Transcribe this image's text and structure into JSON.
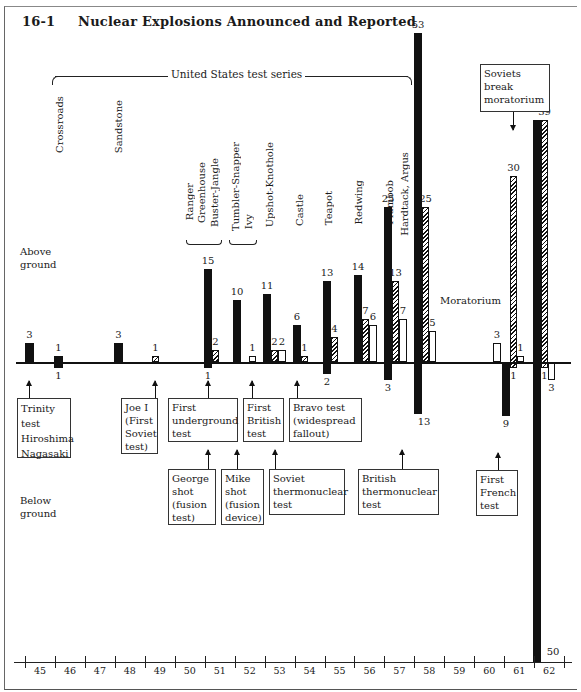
{
  "figure": {
    "number": "16-1",
    "title": "Nuclear Explosions Announced and Reported"
  },
  "labels": {
    "us_series": "United States test series",
    "above_ground": [
      "Above",
      "ground"
    ],
    "below_ground": [
      "Below",
      "ground"
    ],
    "moratorium": "Moratorium"
  },
  "test_series": [
    {
      "name": "Crossroads",
      "year": 46
    },
    {
      "name": "Sandstone",
      "year": 48
    },
    {
      "name": "Ranger",
      "year": 51
    },
    {
      "name": "Greenhouse",
      "year": 51
    },
    {
      "name": "Buster-Jangle",
      "year": 51
    },
    {
      "name": "Tumbler-Snapper",
      "year": 52
    },
    {
      "name": "Ivy",
      "year": 52
    },
    {
      "name": "Upshot-Knothole",
      "year": 53
    },
    {
      "name": "Castle",
      "year": 54
    },
    {
      "name": "Teapot",
      "year": 55
    },
    {
      "name": "Redwing",
      "year": 56
    },
    {
      "name": "Plumbob",
      "year": 57
    },
    {
      "name": "Hardtack, Argus",
      "year": 58
    }
  ],
  "annotations": {
    "above": [
      {
        "text": [
          "Soviets",
          "break",
          "moratorium"
        ],
        "year": 61
      }
    ],
    "row1": [
      {
        "text": [
          "Trinity",
          "test",
          "Hiroshima",
          "Nagasaki"
        ],
        "year": 45
      },
      {
        "text": [
          "Joe I",
          "(First",
          "Soviet",
          "test)"
        ],
        "year": 49
      },
      {
        "text": [
          "First",
          "underground",
          "test"
        ],
        "year": 51
      },
      {
        "text": [
          "First",
          "British",
          "test"
        ],
        "year": 52
      },
      {
        "text": [
          "Bravo test",
          "(widespread",
          "fallout)"
        ],
        "year": 54
      }
    ],
    "row2": [
      {
        "text": [
          "George",
          "shot",
          "(fusion",
          "test)"
        ],
        "year": 51
      },
      {
        "text": [
          "Mike",
          "shot",
          "(fusion",
          "device)"
        ],
        "year": 52
      },
      {
        "text": [
          "Soviet",
          "thermonuclear",
          "test"
        ],
        "year": 53
      },
      {
        "text": [
          "British",
          "thermonuclear",
          "test"
        ],
        "year": 57
      },
      {
        "text": [
          "First",
          "French",
          "test"
        ],
        "year": 60
      }
    ]
  },
  "chart_data": {
    "type": "bar",
    "title": "16-1 Nuclear Explosions Announced and Reported",
    "xlabel": "Year (19xx)",
    "ylabel": "Number of explosions (above ground positive, below ground negative)",
    "categories": [
      "45",
      "46",
      "47",
      "48",
      "49",
      "50",
      "51",
      "52",
      "53",
      "54",
      "55",
      "56",
      "57",
      "58",
      "59",
      "60",
      "61",
      "62"
    ],
    "legend_note": "Solid = United States, Hatched = Soviet Union, Open = Britain/France (no legend shown in figure)",
    "series": [
      {
        "name": "US above ground",
        "style": "solid",
        "values": [
          3,
          0,
          0,
          3,
          0,
          0,
          15,
          10,
          11,
          6,
          13,
          14,
          25,
          53,
          0,
          0,
          0,
          39
        ]
      },
      {
        "name": "US below ground",
        "style": "solid",
        "values": [
          0,
          1,
          0,
          0,
          0,
          0,
          1,
          0,
          0,
          0,
          2,
          0,
          3,
          13,
          0,
          0,
          9,
          50
        ]
      },
      {
        "name": "US 1946 above ground (straddling)",
        "style": "solid",
        "values": [
          0,
          1,
          0,
          0,
          0,
          0,
          0,
          0,
          0,
          0,
          0,
          0,
          0,
          0,
          0,
          0,
          0,
          0
        ]
      },
      {
        "name": "USSR above ground",
        "style": "hatched",
        "values": [
          0,
          0,
          0,
          0,
          1,
          0,
          2,
          0,
          2,
          1,
          4,
          7,
          13,
          25,
          0,
          0,
          30,
          39
        ]
      },
      {
        "name": "USSR below ground",
        "style": "hatched",
        "values": [
          0,
          0,
          0,
          0,
          0,
          0,
          0,
          0,
          0,
          0,
          0,
          0,
          0,
          0,
          0,
          0,
          1,
          1
        ]
      },
      {
        "name": "Other (UK/France) above ground",
        "style": "open",
        "values": [
          0,
          0,
          0,
          0,
          0,
          0,
          0,
          1,
          2,
          0,
          0,
          6,
          7,
          5,
          0,
          3,
          1,
          0
        ]
      },
      {
        "name": "Other (UK/France) below ground",
        "style": "open",
        "values": [
          0,
          0,
          0,
          0,
          0,
          0,
          0,
          0,
          0,
          0,
          0,
          0,
          0,
          0,
          0,
          0,
          0,
          3
        ]
      }
    ],
    "annotations": [
      "Moratorium (1959-60)",
      "Soviets break moratorium (1961)"
    ],
    "grid": false
  },
  "bars": [
    {
      "id": "us45",
      "style": "solid",
      "x": 25,
      "w": 9,
      "up": 3,
      "down": 0,
      "label_up": "3"
    },
    {
      "id": "us46",
      "style": "solid",
      "x": 54,
      "w": 9,
      "up": 1,
      "down": 1,
      "label_up": "1",
      "label_down": "1"
    },
    {
      "id": "us48",
      "style": "solid",
      "x": 114,
      "w": 9,
      "up": 3,
      "down": 0,
      "label_up": "3"
    },
    {
      "id": "su49",
      "style": "hatch",
      "x": 152,
      "w": 7,
      "up": 1,
      "down": 0,
      "label_up": "1"
    },
    {
      "id": "us51",
      "style": "solid",
      "x": 204,
      "w": 8,
      "up": 15,
      "down": 1,
      "label_up": "15",
      "label_down": "1"
    },
    {
      "id": "su51",
      "style": "hatch",
      "x": 212,
      "w": 7,
      "up": 2,
      "down": 0,
      "label_up": "2"
    },
    {
      "id": "us52",
      "style": "solid",
      "x": 233,
      "w": 8,
      "up": 10,
      "down": 0,
      "label_up": "10"
    },
    {
      "id": "uk52",
      "style": "open",
      "x": 249,
      "w": 7,
      "up": 1,
      "down": 0,
      "label_up": "1"
    },
    {
      "id": "us53",
      "style": "solid",
      "x": 263,
      "w": 8,
      "up": 11,
      "down": 0,
      "label_up": "11"
    },
    {
      "id": "su53",
      "style": "hatch",
      "x": 271,
      "w": 7,
      "up": 2,
      "down": 0,
      "label_up": "2"
    },
    {
      "id": "uk53",
      "style": "open",
      "x": 278,
      "w": 8,
      "up": 2,
      "down": 0,
      "label_up": "2"
    },
    {
      "id": "us54",
      "style": "solid",
      "x": 293,
      "w": 8,
      "up": 6,
      "down": 0,
      "label_up": "6"
    },
    {
      "id": "su54",
      "style": "hatch",
      "x": 301,
      "w": 7,
      "up": 1,
      "down": 0,
      "label_up": "1"
    },
    {
      "id": "us55",
      "style": "solid",
      "x": 323,
      "w": 8,
      "up": 13,
      "down": 2,
      "label_up": "13",
      "label_down": "2"
    },
    {
      "id": "su55",
      "style": "hatch",
      "x": 331,
      "w": 7,
      "up": 4,
      "down": 0,
      "label_up": "4"
    },
    {
      "id": "us56",
      "style": "solid",
      "x": 354,
      "w": 8,
      "up": 14,
      "down": 0,
      "label_up": "14"
    },
    {
      "id": "su56",
      "style": "hatch",
      "x": 362,
      "w": 7,
      "up": 7,
      "down": 0,
      "label_up": "7"
    },
    {
      "id": "uk56",
      "style": "open",
      "x": 369,
      "w": 8,
      "up": 6,
      "down": 0,
      "label_up": "6"
    },
    {
      "id": "us57",
      "style": "solid",
      "x": 384,
      "w": 8,
      "up": 25,
      "down": 3,
      "label_up": "25",
      "label_down": "3"
    },
    {
      "id": "su57",
      "style": "hatch",
      "x": 392,
      "w": 7,
      "up": 13,
      "down": 0,
      "label_up": "13"
    },
    {
      "id": "uk57",
      "style": "open",
      "x": 399,
      "w": 8,
      "up": 7,
      "down": 0,
      "label_up": "7"
    },
    {
      "id": "us58",
      "style": "solid",
      "x": 414,
      "w": 8,
      "up": 53,
      "down": 13,
      "label_up": "53",
      "label_down": "13"
    },
    {
      "id": "su58",
      "style": "hatch",
      "x": 422,
      "w": 7,
      "up": 25,
      "down": 0,
      "label_up": "25"
    },
    {
      "id": "uk58",
      "style": "open",
      "x": 429,
      "w": 7,
      "up": 5,
      "down": 0,
      "label_up": "5"
    },
    {
      "id": "fr60",
      "style": "open",
      "x": 493,
      "w": 8,
      "up": 3,
      "down": 0,
      "label_up": "3"
    },
    {
      "id": "us61",
      "style": "solid",
      "x": 502,
      "w": 8,
      "up": 0,
      "down": 9,
      "label_down": "9"
    },
    {
      "id": "su61",
      "style": "hatch",
      "x": 510,
      "w": 7,
      "up": 30,
      "down": 1,
      "label_up": "30",
      "label_down": "1"
    },
    {
      "id": "fr61",
      "style": "open",
      "x": 517,
      "w": 7,
      "up": 1,
      "down": 0,
      "label_up": "1"
    },
    {
      "id": "us62",
      "style": "solid",
      "x": 533,
      "w": 8,
      "up": 39,
      "down": 50,
      "label_down": "50"
    },
    {
      "id": "su62",
      "style": "hatch",
      "x": 541,
      "w": 7,
      "up": 39,
      "down": 1,
      "label_up": "39",
      "label_down": "1"
    },
    {
      "id": "uk62",
      "style": "open",
      "x": 548,
      "w": 7,
      "up": 0,
      "down": 3,
      "label_down": "3"
    }
  ]
}
